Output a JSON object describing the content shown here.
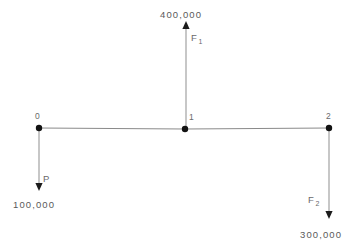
{
  "figure": {
    "title": "",
    "background_color": "#ffffff",
    "line_color": "#8a8a8a",
    "text_color": "#5a5a5a",
    "marker_color": "#121212"
  },
  "nodes": [
    {
      "id": "node-0",
      "label": "0",
      "x": 39,
      "y": 128
    },
    {
      "id": "node-1",
      "label": "1",
      "x": 185,
      "y": 129
    },
    {
      "id": "node-2",
      "label": "2",
      "x": 329,
      "y": 128
    }
  ],
  "forces": [
    {
      "id": "force-p",
      "name": "P",
      "name_base": "P",
      "name_sub": "",
      "magnitude": "100,000",
      "direction": "down",
      "at_node": "0",
      "tip_y": 190
    },
    {
      "id": "force-f1",
      "name": "F1",
      "name_base": "F",
      "name_sub": "1",
      "magnitude": "400,000",
      "direction": "up",
      "at_node": "1",
      "tip_y": 24
    },
    {
      "id": "force-f2",
      "name": "F2",
      "name_base": "F",
      "name_sub": "2",
      "magnitude": "300,000",
      "direction": "down",
      "at_node": "2",
      "tip_y": 218
    }
  ],
  "labels": {
    "value_400000": "400,000",
    "value_100000": "100,000",
    "value_300000": "300,000",
    "node_0": "0",
    "node_1": "1",
    "node_2": "2",
    "force_p": "P",
    "force_f_base": "F",
    "force_f1_sub": "1",
    "force_f2_sub": "2"
  }
}
